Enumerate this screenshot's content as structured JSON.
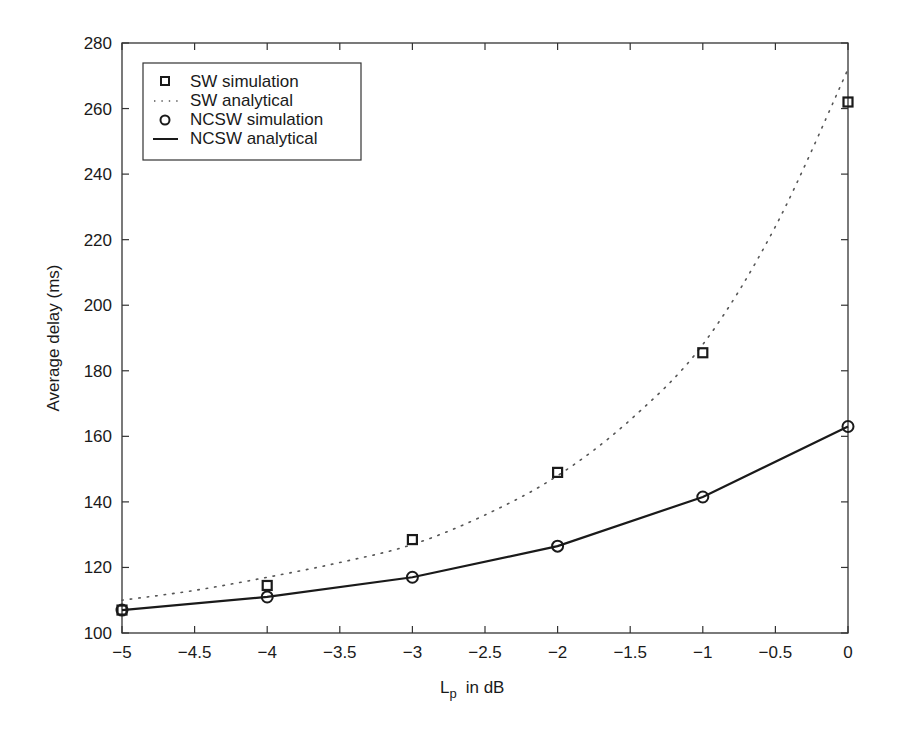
{
  "chart_data": {
    "type": "line",
    "title": "",
    "xlabel": "L_p  in dB",
    "xlabel_main": "L",
    "xlabel_sub": "p",
    "xlabel_rest": "in dB",
    "ylabel": "Average delay (ms)",
    "xlim": [
      -5,
      0
    ],
    "ylim": [
      100,
      280
    ],
    "grid": false,
    "legend_position": "upper left",
    "x_ticks": [
      -5,
      -4.5,
      -4,
      -3.5,
      -3,
      -2.5,
      -2,
      -1.5,
      -1,
      -0.5,
      0
    ],
    "x_tick_labels": [
      "−5",
      "−4.5",
      "−4",
      "−3.5",
      "−3",
      "−2.5",
      "−2",
      "−1.5",
      "−1",
      "−0.5",
      "0"
    ],
    "y_ticks": [
      100,
      120,
      140,
      160,
      180,
      200,
      220,
      240,
      260,
      280
    ],
    "y_tick_labels": [
      "100",
      "120",
      "140",
      "160",
      "180",
      "200",
      "220",
      "240",
      "260",
      "280"
    ],
    "series": [
      {
        "name": "SW simulation",
        "style": "square-marker",
        "x": [
          -5,
          -4,
          -3,
          -2,
          -1,
          0
        ],
        "values": [
          107,
          114.5,
          128.5,
          149,
          185.5,
          262
        ]
      },
      {
        "name": "SW analytical",
        "style": "dotted-line",
        "x": [
          -5,
          -4.5,
          -4,
          -3.5,
          -3,
          -2.5,
          -2,
          -1.5,
          -1,
          -0.5,
          0
        ],
        "values": [
          110,
          113,
          117,
          121.5,
          127,
          136,
          148,
          165,
          188,
          224,
          272
        ]
      },
      {
        "name": "NCSW simulation",
        "style": "circle-marker",
        "x": [
          -5,
          -4,
          -3,
          -2,
          -1,
          0
        ],
        "values": [
          107,
          111,
          117,
          126.5,
          141.5,
          163
        ]
      },
      {
        "name": "NCSW analytical",
        "style": "solid-line",
        "x": [
          -5,
          -4,
          -3,
          -2,
          -1,
          0
        ],
        "values": [
          107,
          111,
          117,
          126.5,
          141.5,
          163
        ]
      }
    ]
  },
  "legend": {
    "items": [
      {
        "label": "SW simulation",
        "icon": "square-marker-icon"
      },
      {
        "label": "SW analytical",
        "icon": "dotted-line-icon"
      },
      {
        "label": "NCSW simulation",
        "icon": "circle-marker-icon"
      },
      {
        "label": "NCSW analytical",
        "icon": "solid-line-icon"
      }
    ]
  },
  "colors": {
    "line": "#1a1a1a",
    "axes": "#333333",
    "background": "#ffffff"
  }
}
